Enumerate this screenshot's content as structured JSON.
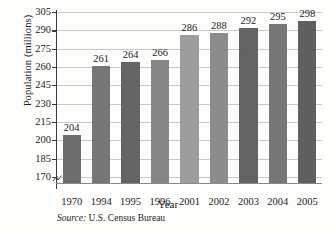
{
  "chart_data": {
    "type": "bar",
    "title": "",
    "xlabel": "Year",
    "ylabel": "Population (millions)",
    "categories": [
      "1970",
      "1994",
      "1995",
      "1996",
      "2001",
      "2002",
      "2003",
      "2004",
      "2005"
    ],
    "values": [
      204,
      261,
      264,
      266,
      286,
      288,
      292,
      295,
      298
    ],
    "value_labels": [
      "204",
      "261",
      "264",
      "266",
      "286",
      "288",
      "292",
      "295",
      "298"
    ],
    "ylim": [
      165,
      305
    ],
    "yticks": [
      170,
      185,
      200,
      215,
      230,
      245,
      260,
      275,
      290,
      305
    ],
    "ytick_labels": [
      "170",
      "185",
      "200",
      "215",
      "230",
      "245",
      "260",
      "275",
      "290",
      "305"
    ],
    "grid": true,
    "legend": false,
    "axis_break": true,
    "bar_colors": [
      "#6e6e6e",
      "#767676",
      "#646464",
      "#858585",
      "#9d9d9d",
      "#8c8c8c",
      "#636363",
      "#777777",
      "#5f5f5f"
    ]
  },
  "source": {
    "label": "Source:",
    "text": "U.S. Census Bureau"
  }
}
